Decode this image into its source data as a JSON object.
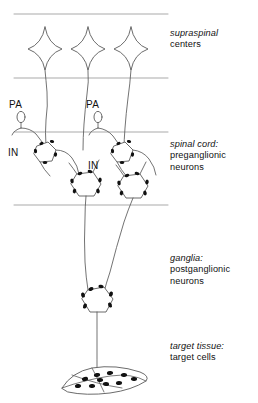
{
  "figure": {
    "colors": {
      "stroke": "#5a5a5a",
      "divider": "#8c8c8c",
      "bouton_fill": "#111111",
      "cell_fill": "#ffffff",
      "text": "#111111",
      "background": "#ffffff"
    },
    "regions": [
      {
        "id": "supraspinal",
        "italic_line": "supraspinal",
        "normal_line": "centers",
        "neuron_count": 3,
        "neuron_shape": "four-pointed-star"
      },
      {
        "id": "spinal-cord",
        "italic_line": "spinal cord:",
        "normal_line_1": "preganglionic",
        "normal_line_2": "neurons",
        "neuron_count": 2,
        "neuron_shape": "pentagon-multipolar"
      },
      {
        "id": "ganglia",
        "italic_line": "ganglia:",
        "normal_line_1": "postganglionic",
        "normal_line_2": "neurons",
        "neuron_count": 1,
        "neuron_shape": "pentagon-multipolar"
      },
      {
        "id": "target-tissue",
        "italic_line": "target tissue:",
        "normal_line": "target cells",
        "cell_shape": "spindle-fiber",
        "nuclei_count": 10
      }
    ],
    "inline_tags": [
      {
        "id": "pa-1",
        "text": "PA"
      },
      {
        "id": "pa-2",
        "text": "PA"
      },
      {
        "id": "in-1",
        "text": "IN"
      },
      {
        "id": "in-2",
        "text": "IN"
      }
    ],
    "divider_lines": [
      {
        "id": "divider-top",
        "y": 14
      },
      {
        "id": "divider-supraspinal-spinal",
        "y": 78
      },
      {
        "id": "divider-spinal-entry",
        "y": 132
      },
      {
        "id": "divider-spinal-bottom",
        "y": 205
      }
    ]
  }
}
